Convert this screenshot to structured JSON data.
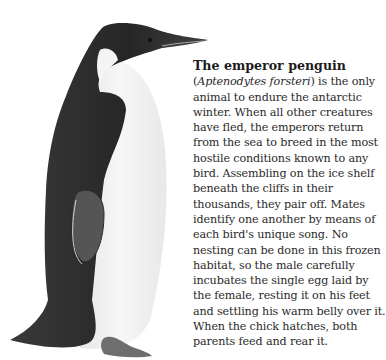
{
  "article": {
    "title": "The emperor penguin",
    "scientific_name": "Aptenodytes forsteri",
    "lines": [
      "is the only",
      "animal to endure the antarctic",
      "winter. When all other creatures",
      "have fled, the emperors return",
      "from the sea to breed in the most",
      "hostile conditions known to any",
      "bird. Assembling on the ice shelf",
      "beneath the cliffs in their",
      "thousands, they pair off. Mates",
      "identify one another by means of",
      "each bird's unique song. No",
      "nesting can be done in this frozen",
      "habitat, so the male carefully",
      "incubates the single egg laid by",
      "the female, resting it on his feet",
      "and settling his warm belly over it.",
      "When the chick hatches, both",
      "parents feed and rear it."
    ]
  },
  "illustration": {
    "subject": "emperor-penguin-illustration",
    "colors": {
      "black": "#1e1e1e",
      "gray": "#555555",
      "white": "#f2f2f2",
      "feet": "#6e6e6e"
    }
  }
}
